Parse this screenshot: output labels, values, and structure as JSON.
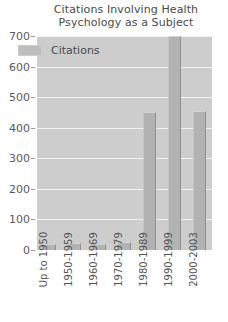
{
  "chart_data": {
    "type": "bar",
    "title": "Citations Involving Health Psychology as a Subject",
    "title_lines": [
      "Citations Involving Health",
      "Psychology as a Subject"
    ],
    "categories": [
      "Up to 1950",
      "1950-1959",
      "1960-1969",
      "1970-1979",
      "1980-1989",
      "1990-1999",
      "2000-2003"
    ],
    "values": [
      20,
      22,
      20,
      25,
      450,
      700,
      455
    ],
    "series": [
      {
        "name": "Citations",
        "values": [
          20,
          22,
          20,
          25,
          450,
          700,
          455
        ]
      }
    ],
    "xlabel": "",
    "ylabel": "",
    "ylim": [
      0,
      700
    ],
    "ytick_labels": [
      "0",
      "100",
      "200",
      "300",
      "400",
      "500",
      "600",
      "700"
    ],
    "ytick_values": [
      0,
      100,
      200,
      300,
      400,
      500,
      600,
      700
    ],
    "grid": true,
    "legend": {
      "position": "inside-top-left",
      "entries": [
        "Citations"
      ]
    },
    "colors": {
      "plot_background": "#cdcdcd",
      "bar_fill": "#b2b2b2",
      "bar_edge": "#8e8e8e",
      "gridline": "#f2f2f2",
      "text": "#555555",
      "page_background": "#ffffff"
    }
  }
}
